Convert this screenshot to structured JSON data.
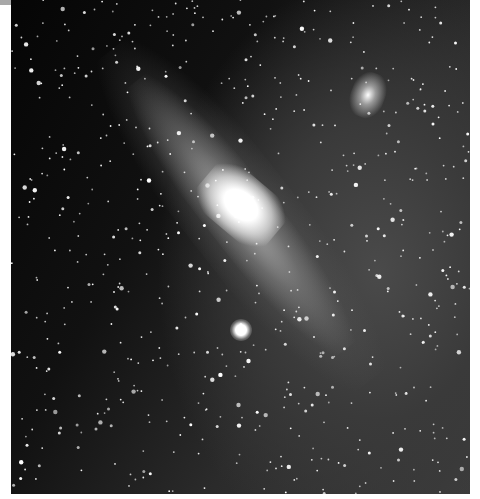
{
  "image": {
    "subject": "Andromeda Galaxy star field",
    "width": 480,
    "height": 499,
    "colors": {
      "sky": "#0a0a0a",
      "core": "#ffffff",
      "margin": "#ffffff",
      "top_bar": "#a8a8a8"
    }
  }
}
